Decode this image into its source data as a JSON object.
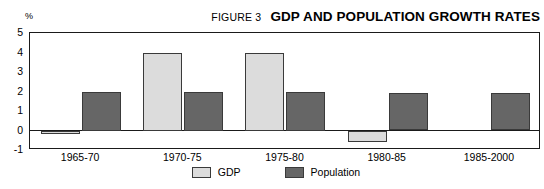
{
  "header": {
    "figure_number": "FIGURE 3",
    "title": "GDP AND POPULATION GROWTH RATES"
  },
  "axis": {
    "unit_label": "%"
  },
  "legend": {
    "entries": [
      {
        "label": "GDP",
        "color": "#dcdcdc",
        "swatch_name": "legend-swatch-gdp"
      },
      {
        "label": "Population",
        "color": "#666666",
        "swatch_name": "legend-swatch-population"
      }
    ]
  },
  "chart_data": {
    "type": "bar",
    "title": "GDP AND POPULATION GROWTH RATES",
    "subtitle": "FIGURE 3",
    "xlabel": "",
    "ylabel": "%",
    "ylim": [
      -1,
      5
    ],
    "yticks": [
      5,
      4,
      3,
      2,
      1,
      0,
      -1
    ],
    "ytick_labels": [
      "5",
      "4",
      "3",
      "2",
      "1",
      "0",
      "-1"
    ],
    "grid": false,
    "legend_position": "bottom-center",
    "categories": [
      "1965-70",
      "1970-75",
      "1975-80",
      "1980-85",
      "1985-2000"
    ],
    "series": [
      {
        "name": "GDP",
        "color": "#dcdcdc",
        "values": [
          -0.2,
          4.0,
          4.0,
          -0.6,
          null
        ]
      },
      {
        "name": "Population",
        "color": "#666666",
        "values": [
          2.0,
          2.0,
          2.0,
          1.9,
          1.9
        ]
      }
    ]
  }
}
